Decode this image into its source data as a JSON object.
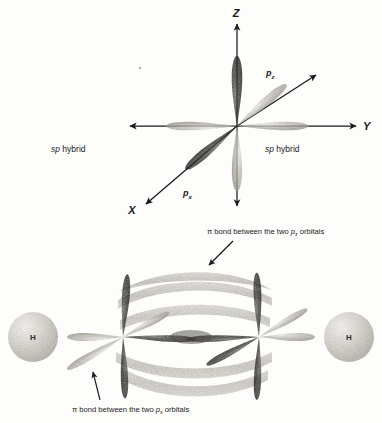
{
  "figure": {
    "background_color": "#fdfdfc",
    "ink_color": "#1a1a1a"
  },
  "top_panel": {
    "name": "sp-hybrid-orbital-axes-diagram",
    "axes": [
      {
        "id": "z",
        "label": "Z",
        "direction": "up"
      },
      {
        "id": "y",
        "label": "Y",
        "direction": "right"
      },
      {
        "id": "x",
        "label": "X",
        "direction": "lower-left"
      }
    ],
    "orbital_labels": [
      {
        "id": "p-vertical",
        "base": "p",
        "subscript": "z"
      },
      {
        "id": "p-diagonal",
        "base": "p",
        "subscript": "x"
      }
    ],
    "hybrid_labels": [
      {
        "id": "sp-hybrid-left",
        "italic": "sp",
        "rest": " hybrid"
      },
      {
        "id": "sp-hybrid-right",
        "italic": "sp",
        "rest": " hybrid"
      }
    ]
  },
  "bottom_panel": {
    "name": "acetylene-pi-bond-diagram",
    "atoms": [
      {
        "id": "hydrogen-left",
        "label": "H"
      },
      {
        "id": "hydrogen-right",
        "label": "H"
      }
    ],
    "captions": [
      {
        "id": "pi-bond-caption-top",
        "prefix": "π bond between the two ",
        "italic": "p",
        "subscript": "z",
        "suffix": " orbitals"
      },
      {
        "id": "pi-bond-caption-bottom",
        "prefix": "π bond between the two ",
        "italic": "p",
        "subscript": "x",
        "suffix": " orbitals"
      }
    ]
  },
  "colors": {
    "lobe_dark": "#2e2c2b",
    "lobe_light": "#b9b5ae",
    "band": "#d6d3cd",
    "sphere": "#cfcbc4",
    "ink": "#1a1a1a"
  }
}
